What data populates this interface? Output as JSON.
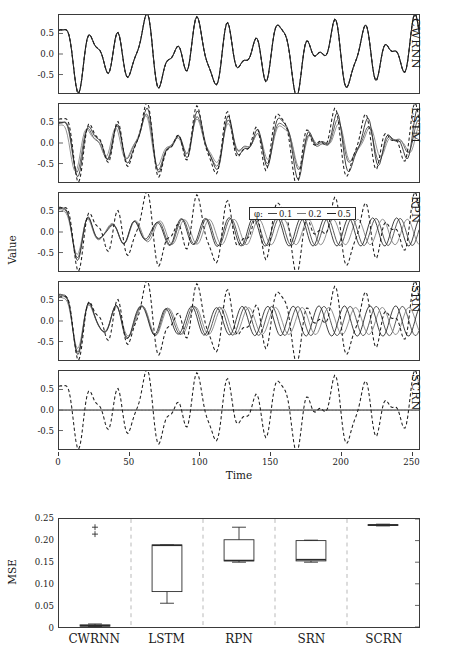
{
  "figure": {
    "top_plot": {
      "ylabel": "Value",
      "xlabel": "Time",
      "yticks": [
        "0.5",
        "0.0",
        "-0.5"
      ],
      "ytick_values": [
        0.5,
        0.0,
        -0.5
      ],
      "ylim": [
        -0.95,
        0.95
      ],
      "xticks": [
        "0",
        "50",
        "100",
        "150",
        "200",
        "250"
      ],
      "xtick_values": [
        0,
        50,
        100,
        150,
        200,
        250
      ],
      "xlim": [
        0,
        256
      ],
      "panels": [
        {
          "label": "CWRNN"
        },
        {
          "label": "LSTM"
        },
        {
          "label": "RPN"
        },
        {
          "label": "SRN"
        },
        {
          "label": "SCRN"
        }
      ],
      "legend": {
        "title": "φ:",
        "items": [
          {
            "label": "0.1",
            "color": "#444444"
          },
          {
            "label": "0.2",
            "color": "#777777"
          },
          {
            "label": "0.5",
            "color": "#222222"
          }
        ]
      }
    },
    "bottom_plot": {
      "ylabel": "MSE",
      "yticks": [
        "0.25",
        "0.20",
        "0.15",
        "0.10",
        "0.05",
        "0"
      ],
      "ytick_values": [
        0.25,
        0.2,
        0.15,
        0.1,
        0.05,
        0
      ],
      "ylim": [
        0,
        0.25
      ],
      "categories": [
        "CWRNN",
        "LSTM",
        "RPN",
        "SRN",
        "SCRN"
      ]
    }
  },
  "chart_data": [
    {
      "type": "line",
      "title": "",
      "subtitle": "Sequence prediction traces per model",
      "xlabel": "Time",
      "ylabel": "Value",
      "xlim": [
        0,
        256
      ],
      "ylim": [
        -0.95,
        0.95
      ],
      "grid": false,
      "legend_position": "inside-upper-center",
      "legend": [
        "0.1",
        "0.2",
        "0.5"
      ],
      "legend_title": "φ",
      "panel_labels": [
        "CWRNN",
        "LSTM",
        "RPN",
        "SRN",
        "SCRN"
      ],
      "series_styles": {
        "target": {
          "dash": "dashed",
          "color": "#1d1d1d"
        },
        "phi_0.1": {
          "dash": "solid",
          "color": "#444444"
        },
        "phi_0.2": {
          "dash": "solid",
          "color": "#777777"
        },
        "phi_0.5": {
          "dash": "solid",
          "color": "#222222"
        }
      },
      "panels": [
        {
          "name": "CWRNN",
          "note": "Prediction overlaps target almost exactly; solid lines hidden beneath dashed target.",
          "target_peaks_t": [
            10,
            36,
            56,
            74,
            104,
            122,
            140,
            160,
            180,
            198,
            218,
            236
          ],
          "target_peaks_v": [
            0.92,
            -0.1,
            0.3,
            0.2,
            -0.95,
            0.95,
            -0.05,
            0.6,
            0.1,
            0.55,
            -0.05,
            0.8
          ]
        },
        {
          "name": "LSTM",
          "note": "Solid predictions track target with growing phase/amplitude error after t=60."
        },
        {
          "name": "RPN",
          "note": "Solid predictions decay toward a small-amplitude oscillation around 0; target dashed keeps full amplitude."
        },
        {
          "name": "SRN",
          "note": "Solid predictions collapse to a regular low-amplitude oscillation; target dashed diverges."
        },
        {
          "name": "SCRN",
          "note": "Solid predictions flat at ~0; only dashed target visible."
        }
      ]
    },
    {
      "type": "box",
      "title": "",
      "xlabel": "",
      "ylabel": "MSE",
      "ylim": [
        0,
        0.25
      ],
      "grid": false,
      "categories": [
        "CWRNN",
        "LSTM",
        "RPN",
        "SRN",
        "SCRN"
      ],
      "boxes": [
        {
          "category": "CWRNN",
          "whisker_low": 0.001,
          "q1": 0.002,
          "median": 0.003,
          "q3": 0.005,
          "whisker_high": 0.007,
          "outliers": [
            0.215,
            0.231
          ]
        },
        {
          "category": "LSTM",
          "whisker_low": 0.055,
          "q1": 0.082,
          "median": 0.189,
          "q3": 0.19,
          "whisker_high": 0.19,
          "outliers": []
        },
        {
          "category": "RPN",
          "whisker_low": 0.15,
          "q1": 0.153,
          "median": 0.154,
          "q3": 0.202,
          "whisker_high": 0.231,
          "outliers": []
        },
        {
          "category": "SRN",
          "whisker_low": 0.15,
          "q1": 0.153,
          "median": 0.156,
          "q3": 0.2,
          "whisker_high": 0.201,
          "outliers": []
        },
        {
          "category": "SCRN",
          "whisker_low": 0.234,
          "q1": 0.235,
          "median": 0.236,
          "q3": 0.237,
          "whisker_high": 0.238,
          "outliers": []
        }
      ]
    }
  ]
}
